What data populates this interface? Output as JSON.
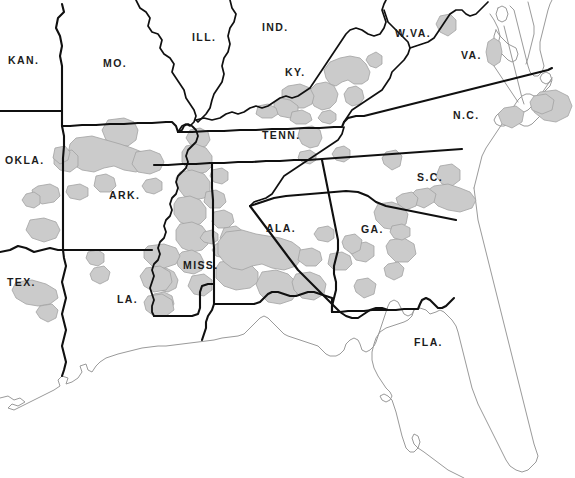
{
  "map": {
    "title": "Southeastern United States Distribution Map",
    "width": 575,
    "height": 478,
    "background_color": "#ffffff",
    "colors": {
      "range_fill": "#cbcbcb",
      "range_outline": "#a2a2a2",
      "state_border": "#101010",
      "coastline": "#9a9a9a",
      "label_text": "#1c1c1c"
    },
    "legend": null,
    "state_labels": [
      {
        "id": "kansas",
        "text": "KAN.",
        "x": 8,
        "y": 55
      },
      {
        "id": "missouri",
        "text": "MO.",
        "x": 103,
        "y": 58
      },
      {
        "id": "illinois",
        "text": "ILL.",
        "x": 192,
        "y": 32
      },
      {
        "id": "indiana",
        "text": "IND.",
        "x": 262,
        "y": 22
      },
      {
        "id": "west-virginia",
        "text": "W.VA.",
        "x": 395,
        "y": 28
      },
      {
        "id": "virginia",
        "text": "VA.",
        "x": 461,
        "y": 50
      },
      {
        "id": "kentucky",
        "text": "KY.",
        "x": 285,
        "y": 67
      },
      {
        "id": "north-carolina",
        "text": "N.C.",
        "x": 453,
        "y": 110
      },
      {
        "id": "tennessee",
        "text": "TENN.",
        "x": 262,
        "y": 130
      },
      {
        "id": "oklahoma",
        "text": "OKLA.",
        "x": 5,
        "y": 155
      },
      {
        "id": "arkansas",
        "text": "ARK.",
        "x": 109,
        "y": 190
      },
      {
        "id": "south-carolina",
        "text": "S.C.",
        "x": 417,
        "y": 172
      },
      {
        "id": "alabama",
        "text": "ALA.",
        "x": 266,
        "y": 223
      },
      {
        "id": "georgia",
        "text": "GA.",
        "x": 361,
        "y": 224
      },
      {
        "id": "mississippi",
        "text": "MISS.",
        "x": 183,
        "y": 260
      },
      {
        "id": "texas",
        "text": "TEX.",
        "x": 7,
        "y": 277
      },
      {
        "id": "louisiana",
        "text": "LA.",
        "x": 117,
        "y": 294
      },
      {
        "id": "florida",
        "text": "FLA.",
        "x": 414,
        "y": 337
      }
    ],
    "range_patch_count": 58
  }
}
